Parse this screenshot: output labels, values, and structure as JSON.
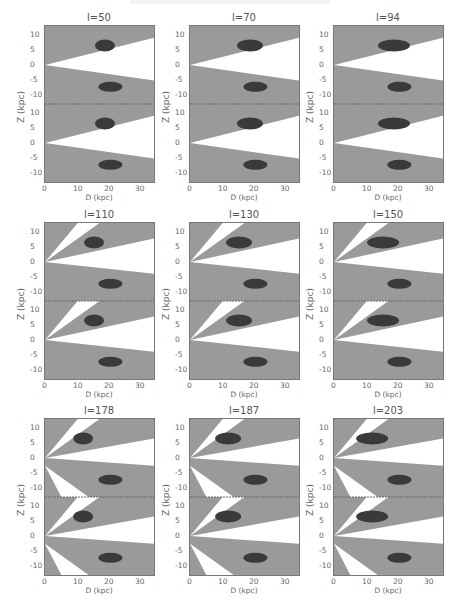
{
  "figure": {
    "rows": 3,
    "cols": 3,
    "colors": {
      "background": "#ffffff",
      "sky": "#9a9a9a",
      "dark": "#3a3a3a",
      "light": "#cfcfcf",
      "frame": "#777777"
    }
  },
  "axes": {
    "xlabel": "D (kpc)",
    "ylabel": "Z (kpc)",
    "xticks": [
      "0",
      "10",
      "20",
      "30"
    ],
    "yticks": [
      "10",
      "5",
      "0",
      "-5",
      "-10"
    ]
  },
  "chart_data": {
    "type": "heatmap",
    "title": "",
    "xlabel": "D (kpc)",
    "ylabel": "Z (kpc)",
    "xlim": [
      0,
      35
    ],
    "ylim": [
      -12,
      12
    ],
    "layout": "3x3 grid, each panel has two stacked sub-panels sharing the D axis",
    "panels": [
      {
        "label": "l=50"
      },
      {
        "label": "l=70"
      },
      {
        "label": "l=94"
      },
      {
        "label": "l=110"
      },
      {
        "label": "l=130"
      },
      {
        "label": "l=150"
      },
      {
        "label": "l=178"
      },
      {
        "label": "l=187"
      },
      {
        "label": "l=203"
      }
    ]
  },
  "panels": [
    {
      "label": "l=50"
    },
    {
      "label": "l=70"
    },
    {
      "label": "l=94"
    },
    {
      "label": "l=110"
    },
    {
      "label": "l=130"
    },
    {
      "label": "l=150"
    },
    {
      "label": "l=178"
    },
    {
      "label": "l=187"
    },
    {
      "label": "l=203"
    }
  ]
}
